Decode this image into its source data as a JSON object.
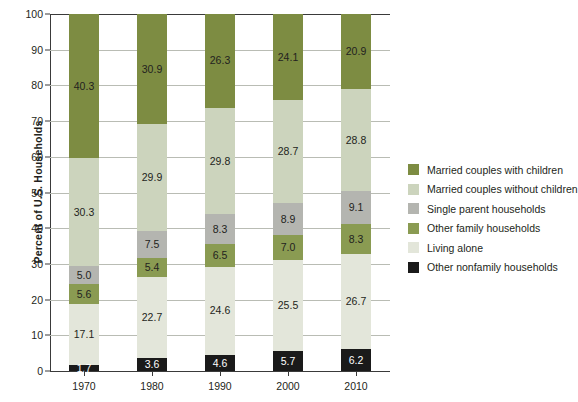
{
  "chart_data": {
    "type": "bar",
    "subtype": "stacked-bar-100",
    "title": "",
    "xlabel": "",
    "ylabel": "Percent of U.S. Households",
    "ylim": [
      0,
      100
    ],
    "ytick_step": 10,
    "yticks": [
      "100",
      "90",
      "80",
      "70",
      "60",
      "50",
      "40",
      "30",
      "20",
      "10",
      "0"
    ],
    "grid": true,
    "grid_axis": "y",
    "legend_position": "right",
    "categories": [
      "1970",
      "1980",
      "1990",
      "2000",
      "2010"
    ],
    "stack_order_bottom_to_top": [
      "Other nonfamily households",
      "Living alone",
      "Other family households",
      "Single parent households",
      "Married couples without children",
      "Married couples with children"
    ],
    "series": [
      {
        "name": "Other nonfamily households",
        "color": "#1a1a1a",
        "label_color": "#ffffff",
        "values": [
          1.7,
          3.6,
          4.6,
          5.7,
          6.2
        ]
      },
      {
        "name": "Living alone",
        "color": "#e3e6da",
        "label_color": "#231f20",
        "values": [
          17.1,
          22.7,
          24.6,
          25.5,
          26.7
        ]
      },
      {
        "name": "Other family households",
        "color": "#8a9b52",
        "label_color": "#231f20",
        "values": [
          5.6,
          5.4,
          6.5,
          7.0,
          8.3
        ]
      },
      {
        "name": "Single parent households",
        "color": "#b4b5b0",
        "label_color": "#231f20",
        "values": [
          5.0,
          7.5,
          8.3,
          8.9,
          9.1
        ]
      },
      {
        "name": "Married couples without children",
        "color": "#ccd4bd",
        "label_color": "#231f20",
        "values": [
          30.3,
          29.9,
          29.8,
          28.7,
          28.8
        ]
      },
      {
        "name": "Married couples with children",
        "color": "#7d8c42",
        "label_color": "#231f20",
        "values": [
          40.3,
          30.9,
          26.3,
          24.1,
          20.9
        ]
      }
    ]
  },
  "legend": {
    "items": [
      {
        "label": "Married couples with children",
        "color": "#7d8c42"
      },
      {
        "label": "Married couples without children",
        "color": "#ccd4bd"
      },
      {
        "label": "Single parent households",
        "color": "#b4b5b0"
      },
      {
        "label": "Other family households",
        "color": "#8a9b52"
      },
      {
        "label": "Living alone",
        "color": "#e3e6da"
      },
      {
        "label": "Other nonfamily households",
        "color": "#1a1a1a"
      }
    ]
  },
  "axis": {
    "y_title": "Percent of U.S. Households"
  }
}
